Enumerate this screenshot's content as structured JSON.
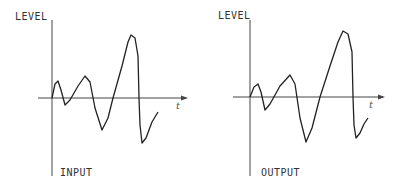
{
  "panels": [
    {
      "name": "input",
      "y_axis_label": "LEVEL",
      "x_axis_label": "t",
      "caption": "INPUT",
      "curve_points": [
        [
          52,
          98
        ],
        [
          55,
          84
        ],
        [
          58,
          81
        ],
        [
          61,
          90
        ],
        [
          65,
          105
        ],
        [
          70,
          100
        ],
        [
          78,
          86
        ],
        [
          85,
          76
        ],
        [
          90,
          82
        ],
        [
          95,
          108
        ],
        [
          102,
          130
        ],
        [
          108,
          118
        ],
        [
          113,
          98
        ],
        [
          122,
          66
        ],
        [
          128,
          42
        ],
        [
          131,
          35
        ],
        [
          135,
          38
        ],
        [
          138,
          56
        ],
        [
          139,
          98
        ],
        [
          140,
          125
        ],
        [
          142,
          143
        ],
        [
          146,
          138
        ],
        [
          152,
          122
        ],
        [
          158,
          112
        ]
      ]
    },
    {
      "name": "output",
      "y_axis_label": "LEVEL",
      "x_axis_label": "t",
      "caption": "OUTPUT",
      "curve_points": [
        [
          250,
          97
        ],
        [
          254,
          87
        ],
        [
          258,
          84
        ],
        [
          261,
          92
        ],
        [
          265,
          110
        ],
        [
          270,
          104
        ],
        [
          280,
          86
        ],
        [
          290,
          75
        ],
        [
          295,
          84
        ],
        [
          300,
          118
        ],
        [
          306,
          142
        ],
        [
          312,
          128
        ],
        [
          320,
          97
        ],
        [
          330,
          66
        ],
        [
          338,
          42
        ],
        [
          343,
          31
        ],
        [
          348,
          34
        ],
        [
          352,
          52
        ],
        [
          353,
          97
        ],
        [
          354,
          125
        ],
        [
          356,
          138
        ],
        [
          360,
          133
        ],
        [
          364,
          124
        ],
        [
          368,
          118
        ]
      ]
    }
  ],
  "colors": {
    "line": "#222222",
    "axis": "#444444"
  }
}
